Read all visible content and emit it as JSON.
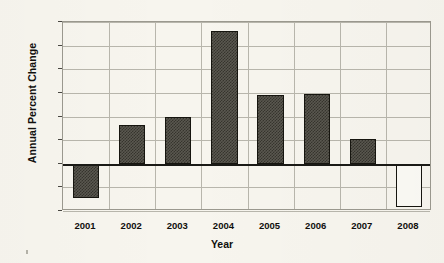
{
  "chart_data": {
    "type": "bar",
    "title": "",
    "xlabel": "Year",
    "ylabel": "Annual Percent Change",
    "categories": [
      "2001",
      "2002",
      "2003",
      "2004",
      "2005",
      "2006",
      "2007",
      "2008"
    ],
    "values": [
      -2.9,
      3.3,
      4.0,
      11.2,
      5.8,
      5.9,
      2.1,
      -3.7
    ],
    "bar_styles": [
      "filled",
      "filled",
      "filled",
      "filled",
      "filled",
      "filled",
      "filled",
      "hollow"
    ],
    "ylim": [
      -4,
      12
    ],
    "yticks": [
      -4,
      -2,
      0,
      2,
      4,
      6,
      8,
      10,
      12
    ],
    "ytick_labels": [
      "-4",
      "-2",
      "0",
      "2",
      "4",
      "6",
      "8",
      "10",
      "12"
    ],
    "grid": true,
    "grid_axis": "both",
    "legend": false,
    "zero_line": true,
    "colors": {
      "background": "#f7f5ee",
      "bar_fill": "#4a4841",
      "bar_hollow_fill": "#fbfaf5",
      "bar_edge": "#16150f",
      "grid": "#b8b6ac",
      "frame": "#9b998f",
      "axis_text": "#100f0d",
      "zero_line": "#1a1a16"
    }
  }
}
